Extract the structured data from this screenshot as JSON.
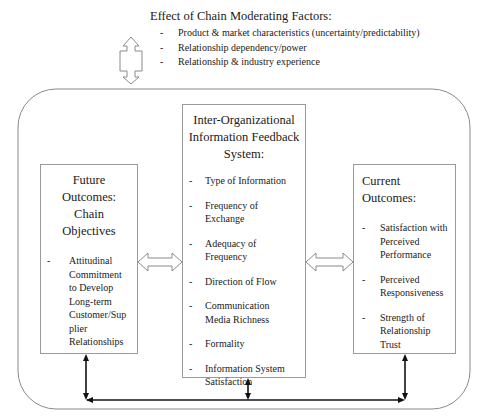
{
  "moderating_factors": {
    "title": "Effect of Chain Moderating Factors:",
    "items": [
      "Product & market characteristics (uncertainty/predictability)",
      "Relationship dependency/power",
      "Relationship & industry experience"
    ]
  },
  "left_box": {
    "title_lines": [
      "Future",
      "Outcomes:",
      "Chain",
      "Objectives"
    ],
    "items": [
      "Attitudinal Commitment to Develop Long-term Customer/Supplier Relationships"
    ],
    "item_lines": [
      [
        "Attitudinal",
        "Commitment",
        "to Develop",
        "Long-term",
        "Customer/Sup",
        "plier",
        "Relationships"
      ]
    ]
  },
  "center_box": {
    "title_lines": [
      "Inter-Organizational",
      "Information Feedback",
      "System:"
    ],
    "items": [
      "Type of Information",
      "Frequency of Exchange",
      "Adequacy of Frequency",
      "Direction of Flow",
      "Communication Media Richness",
      "Formality",
      "Information System Satisfaction"
    ],
    "item_lines": [
      [
        "Type of Information"
      ],
      [
        "Frequency of",
        "Exchange"
      ],
      [
        "Adequacy of",
        "Frequency"
      ],
      [
        "Direction of Flow"
      ],
      [
        "Communication",
        "Media Richness"
      ],
      [
        "Formality"
      ],
      [
        "Information System",
        "Satisfaction"
      ]
    ]
  },
  "right_box": {
    "title_lines": [
      "Current",
      "Outcomes:"
    ],
    "items": [
      "Satisfaction with Perceived Performance",
      "Perceived Responsiveness",
      "Strength of Relationship Trust"
    ],
    "item_lines": [
      [
        "Satisfaction with",
        "Perceived",
        "Performance"
      ],
      [
        "Perceived",
        "Responsiveness"
      ],
      [
        "Strength of",
        "Relationship",
        "Trust"
      ]
    ]
  },
  "bullet": "-",
  "colors": {
    "box_border": "#9a9a9a",
    "outer_border": "#8a8a8a",
    "connector": "#111111",
    "hollow_arrow": "#8a8a8a"
  }
}
